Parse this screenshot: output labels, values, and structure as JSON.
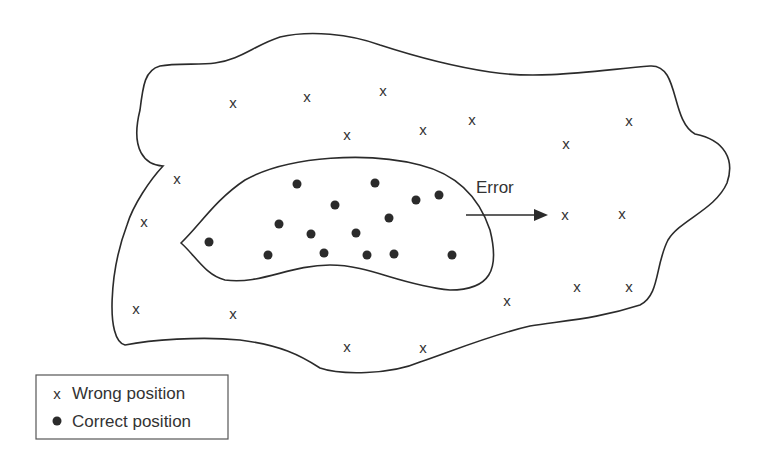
{
  "diagram": {
    "error_label": "Error",
    "colors": {
      "stroke": "#2b2b2b",
      "text": "#333333",
      "dot": "#2b2b2b",
      "background": "#ffffff"
    },
    "wrong_positions": [
      [
        233,
        102
      ],
      [
        307,
        96
      ],
      [
        383,
        90
      ],
      [
        347,
        134
      ],
      [
        423,
        129
      ],
      [
        472,
        119
      ],
      [
        566,
        143
      ],
      [
        629,
        120
      ],
      [
        177,
        178
      ],
      [
        144,
        221
      ],
      [
        565,
        214
      ],
      [
        622,
        213
      ],
      [
        136,
        308
      ],
      [
        233,
        313
      ],
      [
        507,
        300
      ],
      [
        577,
        286
      ],
      [
        629,
        286
      ],
      [
        347,
        346
      ],
      [
        423,
        347
      ]
    ],
    "correct_positions": [
      [
        297,
        184
      ],
      [
        375,
        183
      ],
      [
        335,
        205
      ],
      [
        416,
        200
      ],
      [
        439,
        195
      ],
      [
        279,
        224
      ],
      [
        311,
        234
      ],
      [
        356,
        233
      ],
      [
        389,
        218
      ],
      [
        209,
        242
      ],
      [
        268,
        255
      ],
      [
        324,
        253
      ],
      [
        367,
        255
      ],
      [
        394,
        254
      ],
      [
        452,
        255
      ]
    ]
  },
  "legend": {
    "items": [
      {
        "symbol": "x",
        "label": "Wrong position"
      },
      {
        "symbol": "dot",
        "label": "Correct position"
      }
    ]
  }
}
